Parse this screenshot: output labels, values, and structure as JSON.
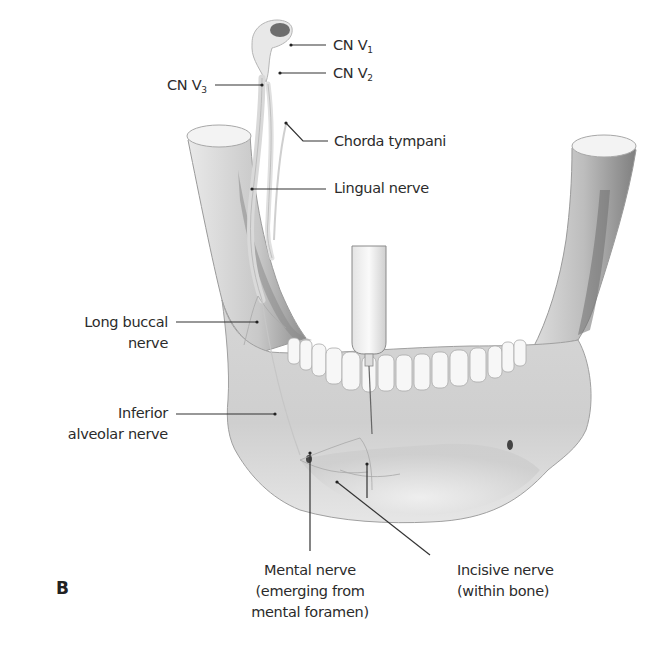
{
  "figure": {
    "panel_letter": "B",
    "labels": {
      "cn_v1": {
        "text": "CN V",
        "sub": "1"
      },
      "cn_v2": {
        "text": "CN V",
        "sub": "2"
      },
      "cn_v3": {
        "text": "CN V",
        "sub": "3"
      },
      "chorda_tympani": "Chorda tympani",
      "lingual_nerve": "Lingual nerve",
      "long_buccal_nerve": {
        "line1": "Long buccal",
        "line2": "nerve"
      },
      "inferior_alveolar_nerve": {
        "line1": "Inferior",
        "line2": "alveolar nerve"
      },
      "mental_nerve": {
        "line1": "Mental nerve",
        "line2": "(emerging from",
        "line3": "mental foramen)"
      },
      "incisive_nerve": {
        "line1": "Incisive nerve",
        "line2": "(within bone)"
      }
    },
    "colors": {
      "background": "#ffffff",
      "label_text": "#2b2b2b",
      "leader_line": "#333333",
      "bone_light": "#ececec",
      "bone_shade": "#b9b9b9",
      "bone_dark": "#8c8c8c"
    }
  }
}
